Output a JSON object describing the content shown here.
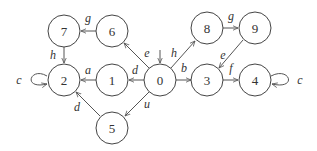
{
  "diagram": {
    "type": "state-transition-graph",
    "initial_state": "0",
    "nodes": [
      {
        "id": "0",
        "label": "0",
        "x": 160,
        "y": 80
      },
      {
        "id": "1",
        "label": "1",
        "x": 112,
        "y": 80
      },
      {
        "id": "2",
        "label": "2",
        "x": 64,
        "y": 80
      },
      {
        "id": "3",
        "label": "3",
        "x": 207,
        "y": 80
      },
      {
        "id": "4",
        "label": "4",
        "x": 255,
        "y": 80
      },
      {
        "id": "5",
        "label": "5",
        "x": 112,
        "y": 128
      },
      {
        "id": "6",
        "label": "6",
        "x": 112,
        "y": 31
      },
      {
        "id": "7",
        "label": "7",
        "x": 64,
        "y": 31
      },
      {
        "id": "8",
        "label": "8",
        "x": 207,
        "y": 28
      },
      {
        "id": "9",
        "label": "9",
        "x": 255,
        "y": 28
      }
    ],
    "edges": [
      {
        "from": "0",
        "to": "1",
        "label": "d"
      },
      {
        "from": "1",
        "to": "2",
        "label": "a"
      },
      {
        "from": "0",
        "to": "6",
        "label": "e"
      },
      {
        "from": "6",
        "to": "7",
        "label": "g"
      },
      {
        "from": "7",
        "to": "2",
        "label": "h"
      },
      {
        "from": "2",
        "to": "2",
        "label": "c"
      },
      {
        "from": "0",
        "to": "5",
        "label": "u"
      },
      {
        "from": "5",
        "to": "2",
        "label": "d"
      },
      {
        "from": "0",
        "to": "8",
        "label": "h"
      },
      {
        "from": "8",
        "to": "9",
        "label": "g"
      },
      {
        "from": "9",
        "to": "3",
        "label": "e"
      },
      {
        "from": "0",
        "to": "3",
        "label": "b"
      },
      {
        "from": "3",
        "to": "4",
        "label": "f"
      },
      {
        "from": "4",
        "to": "4",
        "label": "c"
      }
    ]
  }
}
